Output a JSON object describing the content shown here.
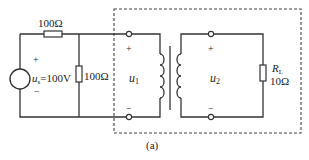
{
  "diagram": {
    "type": "circuit",
    "caption": "(a)",
    "source": {
      "label_var": "u",
      "label_sub": "s",
      "label_value": "=100V",
      "plus": "+",
      "minus": "−"
    },
    "series_resistor": {
      "value": "100Ω"
    },
    "shunt_resistor": {
      "value": "100Ω"
    },
    "transformer": {
      "primary": {
        "var": "u",
        "sub": "1",
        "plus": "+",
        "minus": "−"
      },
      "secondary": {
        "var": "u",
        "sub": "2",
        "plus": "+",
        "minus": "−"
      }
    },
    "load": {
      "name_var": "R",
      "name_sub": "L",
      "value": "10Ω"
    },
    "colors": {
      "line": "#333333",
      "background": "#ffffff"
    }
  }
}
